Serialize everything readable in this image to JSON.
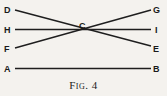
{
  "figure": {
    "caption": "Fig. 4",
    "points": {
      "D": {
        "label": "D",
        "x": 9,
        "y": 10
      },
      "H": {
        "label": "H",
        "x": 9,
        "y": 30
      },
      "F": {
        "label": "F",
        "x": 9,
        "y": 49
      },
      "A": {
        "label": "A",
        "x": 9,
        "y": 69
      },
      "G": {
        "label": "G",
        "x": 158,
        "y": 10
      },
      "I": {
        "label": "I",
        "x": 158,
        "y": 30
      },
      "E": {
        "label": "E",
        "x": 158,
        "y": 49
      },
      "B": {
        "label": "B",
        "x": 158,
        "y": 69
      },
      "C": {
        "label": "C",
        "x": 82,
        "y": 26
      }
    },
    "lines": [
      {
        "name": "line-DE",
        "from": "D",
        "to": "E"
      },
      {
        "name": "line-FG",
        "from": "F",
        "to": "G"
      },
      {
        "name": "line-HI",
        "from": "H",
        "to": "I"
      },
      {
        "name": "line-AB",
        "from": "A",
        "to": "B"
      }
    ]
  }
}
